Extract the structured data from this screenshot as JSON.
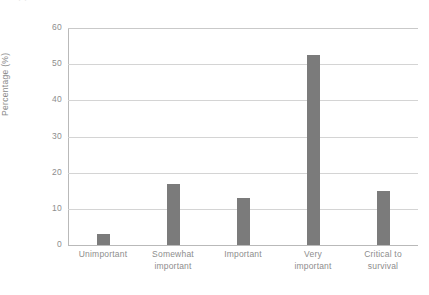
{
  "figure": {
    "top_remnant_text": "·                                                                    ·"
  },
  "chart_data": {
    "type": "bar",
    "title": "",
    "subtitle": "",
    "xlabel": "",
    "ylabel": "Percentage (%)",
    "categories": [
      "Unimportant",
      "Somewhat\nimportant",
      "Important",
      "Very\nimportant",
      "Critical to\nsurvival"
    ],
    "values": [
      3,
      17,
      13,
      52.5,
      15
    ],
    "ylim": [
      0,
      60
    ],
    "yticks": [
      0,
      10,
      20,
      30,
      40,
      50,
      60
    ],
    "ytick_labels": [
      "0",
      "10",
      "20",
      "30",
      "40",
      "50",
      "60"
    ],
    "grid": "horizontal",
    "legend": "none",
    "bar_color": "#7b7b7b",
    "gridline_color": "#d4d4d4",
    "axis_color": "#b9b9b9",
    "label_color": "#8d8d8d",
    "background_color": "#ffffff"
  }
}
